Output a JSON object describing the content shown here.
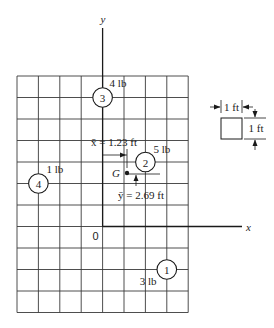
{
  "axes": {
    "x_label": "x",
    "y_label": "y",
    "origin_label": "0"
  },
  "grid": {
    "columns": 8,
    "rows": 11,
    "origin_column": 4,
    "origin_row_from_top": 7,
    "cell_size_ft": 1
  },
  "masses": [
    {
      "id": "1",
      "weight": "3 lb",
      "x_ft": 3,
      "y_ft": -2
    },
    {
      "id": "2",
      "weight": "5 lb",
      "x_ft": 2,
      "y_ft": 3
    },
    {
      "id": "3",
      "weight": "4 lb",
      "x_ft": 0,
      "y_ft": 6
    },
    {
      "id": "4",
      "weight": "1 lb",
      "x_ft": -3,
      "y_ft": 2
    }
  ],
  "centroid": {
    "label": "G",
    "x_bar_text": "x̄ = 1.23 ft",
    "y_bar_text": "ȳ = 2.69 ft",
    "x_bar_ft": 1.23,
    "y_bar_ft": 2.69
  },
  "scale": {
    "width_label": "1 ft",
    "height_label": "1 ft"
  },
  "colors": {
    "ink": "#1a1a1a",
    "grid": "#3a3a3a",
    "background": "#ffffff"
  }
}
